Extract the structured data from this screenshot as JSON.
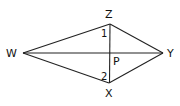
{
  "diagram": {
    "type": "kite-with-diagonals",
    "vertices": {
      "W": {
        "label": "W",
        "x": 23,
        "y": 53
      },
      "Z": {
        "label": "Z",
        "x": 110,
        "y": 24
      },
      "Y": {
        "label": "Y",
        "x": 163,
        "y": 53
      },
      "X": {
        "label": "X",
        "x": 109,
        "y": 83
      }
    },
    "intersection": {
      "label": "P"
    },
    "angles": {
      "angle1": "1",
      "angle2": "2"
    },
    "stroke_color": "#222222"
  }
}
